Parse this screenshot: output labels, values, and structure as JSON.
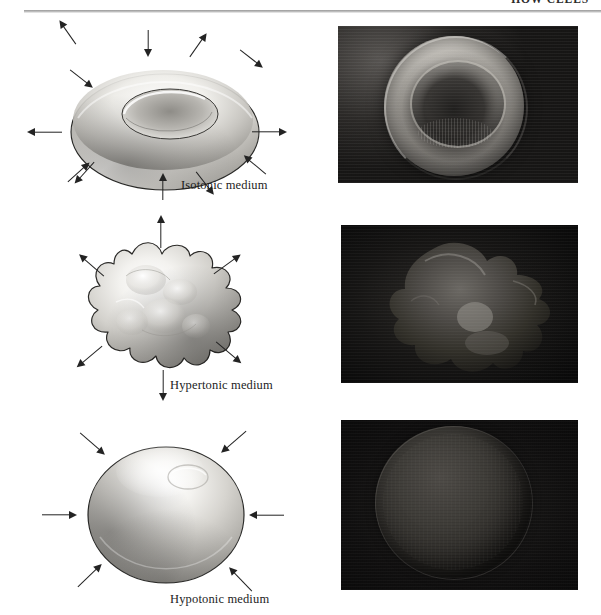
{
  "page": {
    "running_header": "HOW CELLS",
    "width": 601,
    "height": 615,
    "background": "#ffffff"
  },
  "figure": {
    "rows": [
      {
        "id": "isotonic",
        "caption": "Isotonic medium",
        "cell_state": "normal biconcave disc",
        "water_movement": "equal in and out",
        "arrow_pattern": "alternating inward and outward",
        "illustration_name": "biconcave-disc-cell",
        "micrograph_name": "sem-normal-biconcave-rbc",
        "micrograph_tone": "bright cell on dark grainy background"
      },
      {
        "id": "hypertonic",
        "caption": "Hypertonic medium",
        "cell_state": "crenated shrunken cell",
        "water_movement": "out of the cell",
        "arrow_pattern": "all outward",
        "illustration_name": "crenated-cell",
        "micrograph_name": "sem-crenated-rbc",
        "micrograph_tone": "dim spiky cell on black background"
      },
      {
        "id": "hypotonic",
        "caption": "Hypotonic medium",
        "cell_state": "swollen spherical cell",
        "water_movement": "into the cell",
        "arrow_pattern": "all inward",
        "illustration_name": "swollen-spherical-cell",
        "micrograph_name": "sem-swollen-spherical-rbc",
        "micrograph_tone": "dark sphere on black background"
      }
    ]
  },
  "colors": {
    "ink": "#1d1d1d",
    "arrow": "#232323",
    "rule": "#9a9a9a",
    "cell_light": "#f2f1ee",
    "cell_mid": "#b9b7b2",
    "cell_dark": "#6d6b67",
    "photo_bg": "#0b0b0b"
  }
}
